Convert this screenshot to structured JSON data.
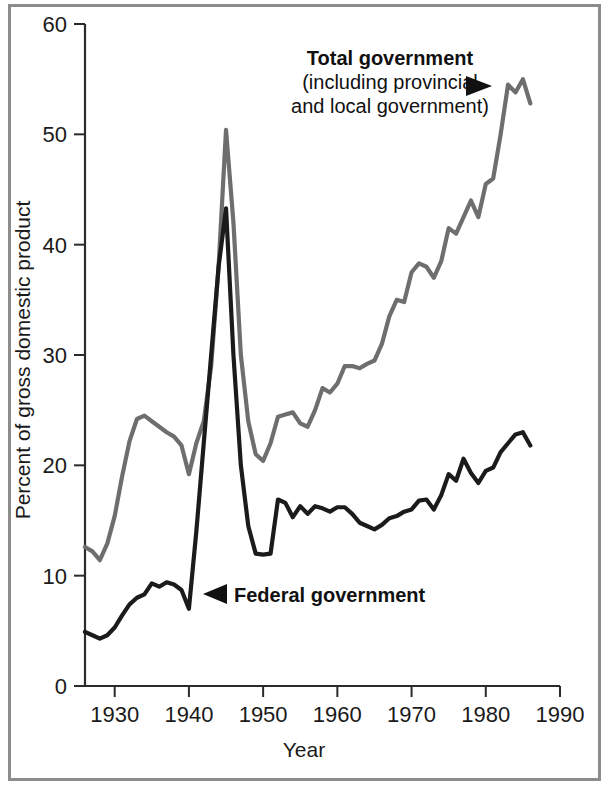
{
  "figure": {
    "name": "government-spending-share-of-gdp-chart",
    "background": "#ffffff",
    "frame_color": "#8c8c8c"
  },
  "chart_data": {
    "type": "line",
    "title": "",
    "xlabel": "Year",
    "ylabel": "Percent of gross domestic product",
    "xlim": [
      1926,
      1990
    ],
    "ylim": [
      0,
      60
    ],
    "xticks": [
      1930,
      1940,
      1950,
      1960,
      1970,
      1980,
      1990
    ],
    "xtick_labels": [
      "1930",
      "1940",
      "1950",
      "1960",
      "1970",
      "1980",
      "1990"
    ],
    "yticks": [
      0,
      10,
      20,
      30,
      40,
      50,
      60
    ],
    "ytick_labels": [
      "0",
      "10",
      "20",
      "30",
      "40",
      "50",
      "60"
    ],
    "grid": false,
    "legend": "annotations-with-arrows",
    "series": [
      {
        "name": "Total government",
        "full_label": "Total government (including provincial and local government)",
        "color": "#6e6e6e",
        "stroke_width": 4.2,
        "x": [
          1926,
          1927,
          1928,
          1929,
          1930,
          1931,
          1932,
          1933,
          1934,
          1935,
          1936,
          1937,
          1938,
          1939,
          1940,
          1941,
          1942,
          1943,
          1944,
          1945,
          1946,
          1947,
          1948,
          1949,
          1950,
          1951,
          1952,
          1953,
          1954,
          1955,
          1956,
          1957,
          1958,
          1959,
          1960,
          1961,
          1962,
          1963,
          1964,
          1965,
          1966,
          1967,
          1968,
          1969,
          1970,
          1971,
          1972,
          1973,
          1974,
          1975,
          1976,
          1977,
          1978,
          1979,
          1980,
          1981,
          1982,
          1983,
          1984,
          1985,
          1986
        ],
        "y": [
          12.6,
          12.2,
          11.4,
          12.9,
          15.4,
          19.0,
          22.2,
          24.2,
          24.5,
          24.0,
          23.5,
          23.0,
          22.6,
          21.8,
          19.2,
          22.0,
          24.0,
          29.0,
          38.0,
          50.4,
          42.0,
          30.0,
          24.0,
          21.0,
          20.4,
          22.0,
          24.4,
          24.6,
          24.8,
          23.8,
          23.5,
          25.0,
          27.0,
          26.6,
          27.4,
          29.0,
          29.0,
          28.8,
          29.2,
          29.5,
          31.0,
          33.5,
          35.0,
          34.8,
          37.5,
          38.3,
          38.0,
          37.0,
          38.5,
          41.5,
          41.0,
          42.5,
          44.0,
          42.5,
          45.5,
          46.0,
          50.0,
          54.5,
          53.8,
          55.0,
          52.8
        ],
        "annotation": {
          "text_lines": [
            "Total government",
            "(including provincial",
            "and local government)"
          ],
          "arrow": "right",
          "points_to_year": 1983
        }
      },
      {
        "name": "Federal government",
        "full_label": "Federal government",
        "color": "#1b1b1b",
        "stroke_width": 4.2,
        "x": [
          1926,
          1927,
          1928,
          1929,
          1930,
          1931,
          1932,
          1933,
          1934,
          1935,
          1936,
          1937,
          1938,
          1939,
          1940,
          1941,
          1942,
          1943,
          1944,
          1945,
          1946,
          1947,
          1948,
          1949,
          1950,
          1951,
          1952,
          1953,
          1954,
          1955,
          1956,
          1957,
          1958,
          1959,
          1960,
          1961,
          1962,
          1963,
          1964,
          1965,
          1966,
          1967,
          1968,
          1969,
          1970,
          1971,
          1972,
          1973,
          1974,
          1975,
          1976,
          1977,
          1978,
          1979,
          1980,
          1981,
          1982,
          1983,
          1984,
          1985,
          1986
        ],
        "y": [
          4.9,
          4.6,
          4.3,
          4.6,
          5.3,
          6.4,
          7.4,
          8.0,
          8.3,
          9.3,
          9.0,
          9.4,
          9.2,
          8.7,
          7.0,
          14.0,
          22.0,
          30.0,
          38.0,
          43.3,
          30.0,
          20.0,
          14.5,
          12.0,
          11.9,
          12.0,
          16.9,
          16.6,
          15.3,
          16.3,
          15.6,
          16.3,
          16.1,
          15.8,
          16.2,
          16.2,
          15.6,
          14.8,
          14.5,
          14.2,
          14.6,
          15.2,
          15.4,
          15.8,
          16.0,
          16.8,
          16.9,
          16.0,
          17.3,
          19.2,
          18.6,
          20.6,
          19.3,
          18.4,
          19.5,
          19.8,
          21.2,
          22.0,
          22.8,
          23.0,
          21.8
        ],
        "annotation": {
          "text_lines": [
            "Federal government"
          ],
          "arrow": "left",
          "points_to_year": 1940
        }
      }
    ]
  }
}
